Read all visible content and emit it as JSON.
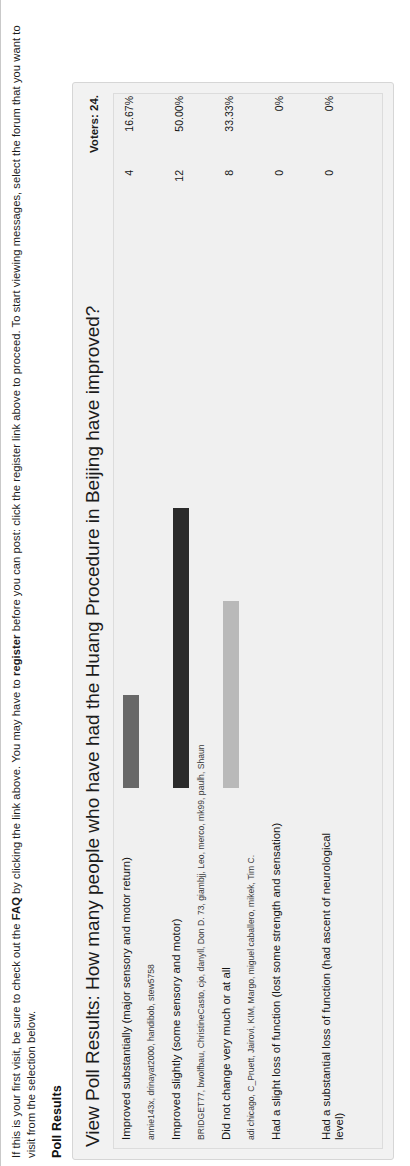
{
  "notice": {
    "text_before_faq": "If this is your first visit, be sure to check out the ",
    "faq_link": "FAQ",
    "text_after_faq": " by clicking the link above. You may have to ",
    "register_link": "register",
    "text_after_register": " before you can post: click the register link above to proceed. To start viewing messages, select the forum that you want to visit from the selection below."
  },
  "poll_results_heading": "Poll Results",
  "poll": {
    "title": "View Poll Results: How many people who have had the Huang Procedure in Beijing have improved?",
    "voters": "Voters: 24.",
    "rows": [
      {
        "label": "Improved substantially (major sensory and motor return)",
        "voters": "annie143x, drinayat2000, handibob, stew5758",
        "count": "4",
        "percent": "16.67%",
        "bar_color": "#686868",
        "bar_width_px": 93
      },
      {
        "label": "Improved slightly (some sensory and motor)",
        "voters": "BRIDGET77, bwolfbau, ChristineCasto, cjo, danyll, Don D. 73, giambjj, Leo, merco, mk99, paulh, Shaun",
        "count": "12",
        "percent": "50.00%",
        "bar_color": "#2b2b2b",
        "bar_width_px": 280
      },
      {
        "label": "Did not change very much or at all",
        "voters": "adi chicago, C_Pruett, Jairovi, KIM, Margo, miguel caballero, mikek, Tim C.",
        "count": "8",
        "percent": "33.33%",
        "bar_color": "#b9b9b9",
        "bar_width_px": 187
      },
      {
        "label": "Had a slight loss of function (lost some strength and sensation)",
        "voters": "",
        "count": "0",
        "percent": "0%",
        "bar_color": "#8d8d8d",
        "bar_width_px": 0
      },
      {
        "label": "Had a substantial loss of function (had ascent of neurological level)",
        "voters": "",
        "count": "0",
        "percent": "0%",
        "bar_color": "#8d8d8d",
        "bar_width_px": 0
      }
    ]
  },
  "colors": {
    "panel_bg": "#f2f2f2",
    "table_bg": "#f0f0f0",
    "page_bg": "#ffffff",
    "text": "#1a1a1a"
  }
}
